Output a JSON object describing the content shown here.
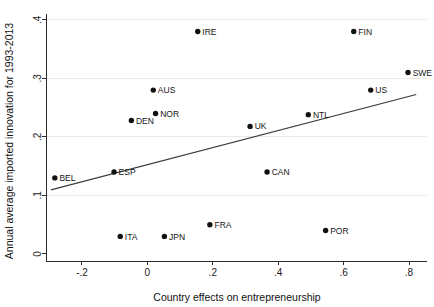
{
  "chart_data": {
    "type": "scatter",
    "title": "",
    "xlabel": "Country effects on entrepreneurship",
    "ylabel": "Annual average imported innovation for 1993-2013",
    "xlim": [
      -0.31,
      0.855
    ],
    "ylim": [
      -0.012,
      0.41
    ],
    "xticks": [
      -0.2,
      0,
      0.2,
      0.4,
      0.6,
      0.8
    ],
    "xticklabels": [
      "-.2",
      "0",
      ".2",
      ".4",
      ".6",
      ".8"
    ],
    "yticks": [
      0,
      0.1,
      0.2,
      0.3,
      0.4
    ],
    "yticklabels": [
      "0",
      ".1",
      ".2",
      ".3",
      ".4"
    ],
    "grid": "horizontal",
    "legend": "none",
    "marker": "filled-circle",
    "marker_color": "#111111",
    "points": [
      {
        "label": "BEL",
        "x": -0.283,
        "y": 0.13,
        "label_pos": "right"
      },
      {
        "label": "ESP",
        "x": -0.102,
        "y": 0.14,
        "label_pos": "right"
      },
      {
        "label": "ITA",
        "x": -0.083,
        "y": 0.03,
        "label_pos": "right"
      },
      {
        "label": "DEN",
        "x": -0.049,
        "y": 0.228,
        "label_pos": "right"
      },
      {
        "label": "AUS",
        "x": 0.018,
        "y": 0.28,
        "label_pos": "right"
      },
      {
        "label": "NOR",
        "x": 0.025,
        "y": 0.24,
        "label_pos": "right"
      },
      {
        "label": "JPN",
        "x": 0.052,
        "y": 0.03,
        "label_pos": "right"
      },
      {
        "label": "IRE",
        "x": 0.154,
        "y": 0.38,
        "label_pos": "right"
      },
      {
        "label": "FRA",
        "x": 0.191,
        "y": 0.05,
        "label_pos": "right"
      },
      {
        "label": "UK",
        "x": 0.314,
        "y": 0.218,
        "label_pos": "right"
      },
      {
        "label": "CAN",
        "x": 0.366,
        "y": 0.14,
        "label_pos": "right"
      },
      {
        "label": "NTL",
        "x": 0.492,
        "y": 0.238,
        "label_pos": "right"
      },
      {
        "label": "POR",
        "x": 0.545,
        "y": 0.04,
        "label_pos": "right"
      },
      {
        "label": "FIN",
        "x": 0.631,
        "y": 0.38,
        "label_pos": "right"
      },
      {
        "label": "US",
        "x": 0.683,
        "y": 0.28,
        "label_pos": "right"
      },
      {
        "label": "SWE",
        "x": 0.797,
        "y": 0.31,
        "label_pos": "right"
      }
    ],
    "fit_line": {
      "type": "linear",
      "x_start": -0.295,
      "y_start": 0.1095,
      "x_end": 0.822,
      "y_end": 0.2725
    }
  }
}
